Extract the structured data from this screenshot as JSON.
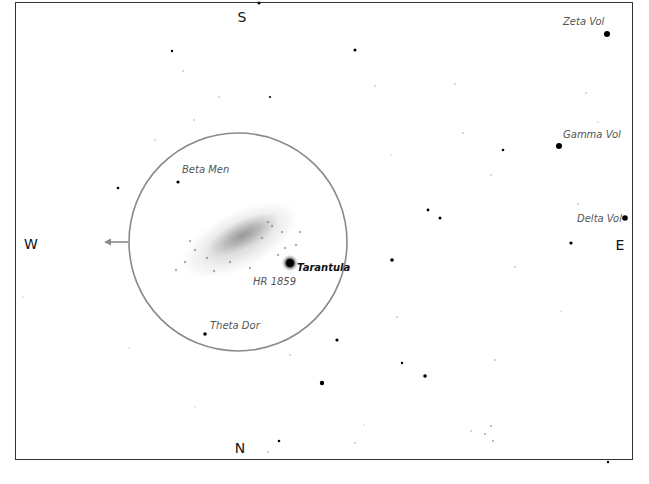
{
  "chart": {
    "title": "",
    "type": "star-chart",
    "frame": {
      "x": 15,
      "y": 2,
      "w": 618,
      "h": 458
    },
    "directions": [
      {
        "id": "S",
        "label": "S",
        "x": 242,
        "y": 17
      },
      {
        "id": "N",
        "label": "N",
        "x": 240,
        "y": 448
      },
      {
        "id": "W",
        "label": "W",
        "x": 31,
        "y": 244
      },
      {
        "id": "E",
        "label": "E",
        "x": 620,
        "y": 245
      }
    ],
    "field_circle": {
      "cx": 238,
      "cy": 242,
      "r": 109,
      "color": "#8a8a8a"
    },
    "direction_arrow": {
      "from_x": 128,
      "to_x": 104,
      "y": 242,
      "color": "#8a8a8a"
    },
    "labels": [
      {
        "id": "zeta-vol",
        "text": "Zeta Vol",
        "x": 563,
        "y": 22,
        "bold": false
      },
      {
        "id": "gamma-vol",
        "text": "Gamma Vol",
        "x": 563,
        "y": 135,
        "bold": false
      },
      {
        "id": "delta-vol",
        "text": "Delta Vol",
        "x": 577,
        "y": 219,
        "bold": false
      },
      {
        "id": "beta-men",
        "text": "Beta Men",
        "x": 182,
        "y": 170,
        "bold": false
      },
      {
        "id": "tarantula",
        "text": "Tarantula",
        "x": 297,
        "y": 268,
        "bold": true
      },
      {
        "id": "hr-1859",
        "text": "HR 1859",
        "x": 253,
        "y": 282,
        "bold": false
      },
      {
        "id": "theta-dor",
        "text": "Theta Dor",
        "x": 210,
        "y": 326,
        "bold": false
      }
    ],
    "stars": [
      {
        "x": 259,
        "y": 3,
        "r": 1.5
      },
      {
        "x": 172,
        "y": 51,
        "r": 1.2
      },
      {
        "x": 355,
        "y": 50,
        "r": 1.5
      },
      {
        "x": 607,
        "y": 34,
        "r": 3
      },
      {
        "x": 270,
        "y": 97,
        "r": 1.1
      },
      {
        "x": 559,
        "y": 146,
        "r": 3
      },
      {
        "x": 503,
        "y": 150,
        "r": 1.3
      },
      {
        "x": 178,
        "y": 182,
        "r": 1.6
      },
      {
        "x": 118,
        "y": 188,
        "r": 1.3
      },
      {
        "x": 428,
        "y": 210,
        "r": 1.4
      },
      {
        "x": 440,
        "y": 218,
        "r": 1.5
      },
      {
        "x": 625,
        "y": 218,
        "r": 2.8
      },
      {
        "x": 571,
        "y": 243,
        "r": 1.6
      },
      {
        "x": 392,
        "y": 260,
        "r": 1.8
      },
      {
        "x": 290,
        "y": 263,
        "r": 4
      },
      {
        "x": 255,
        "y": 280,
        "r": 0.9
      },
      {
        "x": 205,
        "y": 334,
        "r": 1.8
      },
      {
        "x": 337,
        "y": 340,
        "r": 1.6
      },
      {
        "x": 402,
        "y": 363,
        "r": 1.2
      },
      {
        "x": 425,
        "y": 376,
        "r": 1.8
      },
      {
        "x": 322,
        "y": 383,
        "r": 2.2
      },
      {
        "x": 279,
        "y": 441,
        "r": 1.3
      },
      {
        "x": 268,
        "y": 452,
        "r": 0.8
      },
      {
        "x": 491,
        "y": 426,
        "r": 0.9
      },
      {
        "x": 485,
        "y": 434,
        "r": 0.9
      },
      {
        "x": 493,
        "y": 441,
        "r": 0.9
      },
      {
        "x": 471,
        "y": 431,
        "r": 0.7
      },
      {
        "x": 608,
        "y": 462,
        "r": 1.2
      },
      {
        "x": 183,
        "y": 71,
        "r": 0.7
      },
      {
        "x": 219,
        "y": 97,
        "r": 0.7
      },
      {
        "x": 194,
        "y": 120,
        "r": 0.7
      },
      {
        "x": 155,
        "y": 140,
        "r": 0.7
      },
      {
        "x": 375,
        "y": 86,
        "r": 0.7
      },
      {
        "x": 455,
        "y": 84,
        "r": 0.7
      },
      {
        "x": 463,
        "y": 133,
        "r": 0.7
      },
      {
        "x": 391,
        "y": 155,
        "r": 0.6
      },
      {
        "x": 491,
        "y": 175,
        "r": 0.7
      },
      {
        "x": 586,
        "y": 93,
        "r": 0.7
      },
      {
        "x": 598,
        "y": 122,
        "r": 0.6
      },
      {
        "x": 578,
        "y": 204,
        "r": 0.7
      },
      {
        "x": 515,
        "y": 267,
        "r": 0.7
      },
      {
        "x": 397,
        "y": 317,
        "r": 0.7
      },
      {
        "x": 495,
        "y": 360,
        "r": 0.8
      },
      {
        "x": 561,
        "y": 311,
        "r": 0.6
      },
      {
        "x": 129,
        "y": 348,
        "r": 0.6
      },
      {
        "x": 23,
        "y": 297,
        "r": 0.6
      },
      {
        "x": 355,
        "y": 443,
        "r": 0.7
      },
      {
        "x": 364,
        "y": 425,
        "r": 0.6
      },
      {
        "x": 290,
        "y": 355,
        "r": 0.7
      },
      {
        "x": 195,
        "y": 407,
        "r": 0.5
      }
    ],
    "lmc": {
      "cx": 240,
      "cy": 240,
      "rx": 58,
      "ry": 20,
      "angle": -27
    }
  }
}
